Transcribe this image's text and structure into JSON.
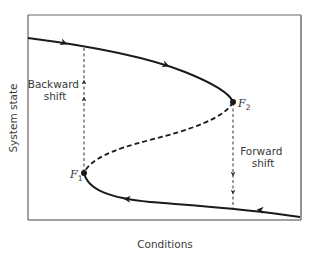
{
  "figure": {
    "type": "fold-bifurcation-hysteresis",
    "x_axis_label": "Conditions",
    "y_axis_label": "System state",
    "points": [
      {
        "id": "F1",
        "label": "F",
        "subscript": "1"
      },
      {
        "id": "F2",
        "label": "F",
        "subscript": "2"
      }
    ],
    "annotations": {
      "backward_shift": [
        "Backward",
        "shift"
      ],
      "forward_shift": [
        "Forward",
        "shift"
      ]
    },
    "branches": [
      {
        "name": "upper-stable",
        "style": "solid",
        "direction": "rightward"
      },
      {
        "name": "middle-unstable",
        "style": "dashed"
      },
      {
        "name": "lower-stable",
        "style": "solid",
        "direction": "leftward"
      }
    ],
    "colors": {
      "curve": "#1a1a1a",
      "frame": "#555555",
      "text": "#3a3a3a"
    }
  }
}
